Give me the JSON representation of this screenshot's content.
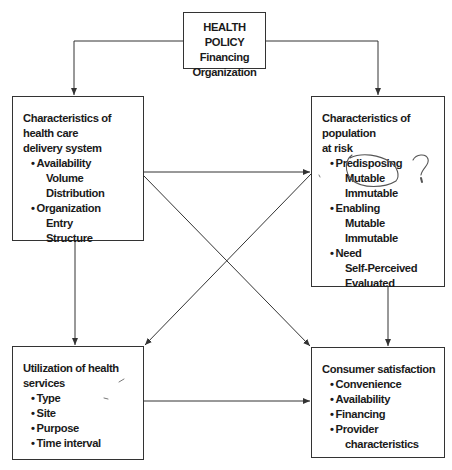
{
  "diagram": {
    "nodes": {
      "health_policy": {
        "heading": "HEALTH POLICY",
        "items": [
          "Financing",
          "Organization"
        ]
      },
      "delivery_system": {
        "title_line1": "Characteristics of health care",
        "title_line2": "delivery system",
        "bullets": [
          {
            "label": "Availability",
            "sub": [
              "Volume",
              "Distribution"
            ]
          },
          {
            "label": "Organization",
            "sub": [
              "Entry",
              "Structure"
            ]
          }
        ]
      },
      "population": {
        "title_line1": "Characteristics of population",
        "title_line2": "at risk",
        "bullets": [
          {
            "label": "Predisposing",
            "sub": [
              "Mutable",
              "Immutable"
            ]
          },
          {
            "label": "Enabling",
            "sub": [
              "Mutable",
              "Immutable"
            ]
          },
          {
            "label": "Need",
            "sub": [
              "Self-Perceived",
              "Evaluated"
            ]
          }
        ]
      },
      "utilization": {
        "title_line1": "Utilization of health",
        "title_line2": "services",
        "bullets": [
          "Type",
          "Site",
          "Purpose",
          "Time interval"
        ]
      },
      "satisfaction": {
        "title": "Consumer satisfaction",
        "bullets": [
          "Convenience",
          "Availability",
          "Financing",
          "Provider"
        ],
        "continuation": "characteristics"
      }
    },
    "edges": [
      {
        "from": "health_policy",
        "to": "delivery_system"
      },
      {
        "from": "health_policy",
        "to": "population"
      },
      {
        "from": "delivery_system",
        "to": "population"
      },
      {
        "from": "delivery_system",
        "to": "utilization"
      },
      {
        "from": "delivery_system",
        "to": "satisfaction"
      },
      {
        "from": "population",
        "to": "utilization"
      },
      {
        "from": "population",
        "to": "satisfaction"
      },
      {
        "from": "utilization",
        "to": "satisfaction"
      }
    ],
    "annotations": {
      "handwritten_mark": "?",
      "circled_items": [
        "Mutable",
        "Immutable"
      ]
    },
    "colors": {
      "line": "#333333",
      "ink": "#555555",
      "text": "#1a1a1a"
    }
  }
}
